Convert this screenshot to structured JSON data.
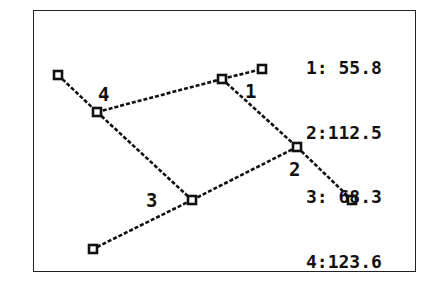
{
  "diagram": {
    "type": "calculator-graph-screen",
    "frame": {
      "x": 33,
      "y": 10,
      "w": 383,
      "h": 262
    },
    "line_color": "#111111",
    "nodes": [
      {
        "id": "a",
        "x": 58,
        "y": 75
      },
      {
        "id": "n4",
        "x": 97,
        "y": 112
      },
      {
        "id": "n1a",
        "x": 222,
        "y": 79
      },
      {
        "id": "b",
        "x": 262,
        "y": 69
      },
      {
        "id": "n2",
        "x": 297,
        "y": 147
      },
      {
        "id": "c",
        "x": 352,
        "y": 200
      },
      {
        "id": "n3",
        "x": 192,
        "y": 200
      },
      {
        "id": "d",
        "x": 93,
        "y": 249
      }
    ],
    "edges": [
      [
        "a",
        "n4"
      ],
      [
        "n4",
        "n1a"
      ],
      [
        "n1a",
        "b"
      ],
      [
        "n4",
        "n3"
      ],
      [
        "n1a",
        "n2"
      ],
      [
        "n2",
        "c"
      ],
      [
        "n3",
        "n2"
      ],
      [
        "n3",
        "d"
      ]
    ],
    "angle_labels": [
      {
        "text": "4",
        "x": 98,
        "y": 85
      },
      {
        "text": "1",
        "x": 245,
        "y": 82
      },
      {
        "text": "2",
        "x": 289,
        "y": 160
      },
      {
        "text": "3",
        "x": 146,
        "y": 191
      }
    ]
  },
  "legend": {
    "rows": [
      {
        "label": "1:",
        "value": " 55.8"
      },
      {
        "label": "2:",
        "value": "112.5"
      },
      {
        "label": "3:",
        "value": " 68.3"
      },
      {
        "label": "4:",
        "value": "123.6"
      }
    ]
  }
}
